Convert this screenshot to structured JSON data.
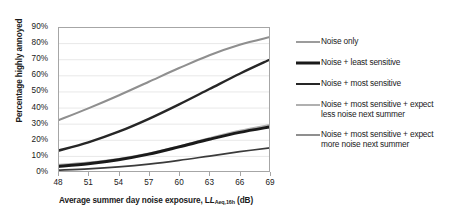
{
  "chart_data": {
    "type": "line",
    "title": "",
    "xlabel": "Average summer day noise exposure, L",
    "xlabel_sub": "Aeq,16h",
    "xlabel_unit": " (dB)",
    "ylabel": "Percentage highly annoyed",
    "xlim": [
      48,
      69
    ],
    "ylim": [
      0,
      90
    ],
    "xticks": [
      "48",
      "51",
      "54",
      "57",
      "60",
      "63",
      "66",
      "69"
    ],
    "yticks": [
      "0%",
      "10%",
      "20%",
      "30%",
      "40%",
      "50%",
      "60%",
      "70%",
      "80%",
      "90%"
    ],
    "grid": "horizontal",
    "legend_position": "right",
    "x": [
      48,
      51,
      54,
      57,
      60,
      63,
      66,
      69
    ],
    "series": [
      {
        "name": "Noise only",
        "color": "#3b3b3b",
        "width": 1.7,
        "values": [
          1.2,
          2.0,
          3.2,
          4.9,
          7.2,
          9.9,
          12.6,
          15.0
        ]
      },
      {
        "name": "Noise + least sensitive",
        "color": "#1a1a1a",
        "width": 3.0,
        "values": [
          3.4,
          5.1,
          7.6,
          11.1,
          15.6,
          20.3,
          24.6,
          28.0
        ]
      },
      {
        "name": "Noise + most sensitive",
        "color": "#262626",
        "width": 2.4,
        "values": [
          13.2,
          18.4,
          25.0,
          33.0,
          42.0,
          51.5,
          61.0,
          69.8
        ]
      },
      {
        "name": "Noise + most sensitive + expect less noise next summer",
        "color": "#b0b0b0",
        "width": 2.1,
        "values": [
          4.4,
          5.9,
          8.1,
          11.4,
          15.9,
          21.0,
          25.6,
          29.2
        ]
      },
      {
        "name": "Noise + most sensitive + expect more noise next summer",
        "color": "#8f8f8f",
        "width": 2.1,
        "values": [
          32.0,
          39.5,
          47.5,
          56.0,
          64.5,
          72.5,
          79.0,
          83.8
        ]
      }
    ]
  },
  "legend": {
    "entries": [
      {
        "label": "Noise only"
      },
      {
        "label": "Noise + least sensitive"
      },
      {
        "label": "Noise + most sensitive"
      },
      {
        "label_line1": "Noise + most sensitive + expect",
        "label_line2": "less noise next summer"
      },
      {
        "label_line1": "Noise + most sensitive + expect",
        "label_line2": "more noise next summer"
      }
    ]
  },
  "colors": {
    "frame": "#a6a6a6",
    "grid": "#e8e8e8",
    "text": "#1a1a1a",
    "background": "#ffffff"
  }
}
